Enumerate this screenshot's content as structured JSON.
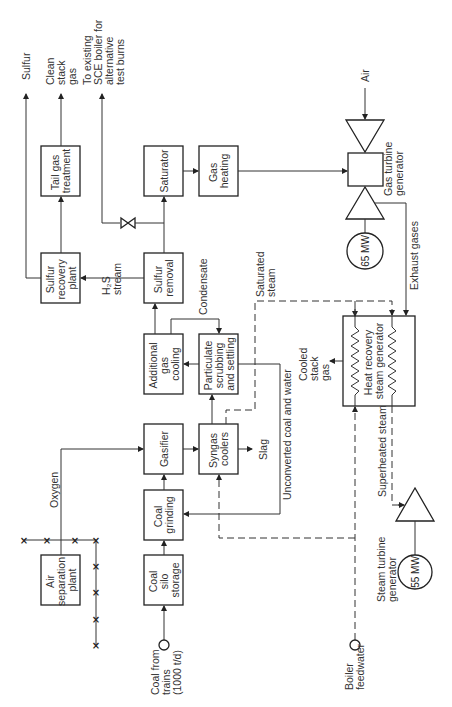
{
  "diagram": {
    "title": "",
    "boxes": {
      "tail_gas": [
        "Tail gas",
        "treatment"
      ],
      "saturator": [
        "Saturator"
      ],
      "gas_heating": [
        "Gas",
        "heating"
      ],
      "sulfur_recovery": [
        "Sulfur",
        "recovery",
        "plant"
      ],
      "sulfur_removal": [
        "Sulfur",
        "removal"
      ],
      "additional_cooling": [
        "Additional",
        "gas",
        "cooling"
      ],
      "particulate": [
        "Particulate",
        "scrubbing",
        "and settling"
      ],
      "gasifier": [
        "Gasifier"
      ],
      "syngas_coolers": [
        "Syngas",
        "coolers"
      ],
      "coal_grinding": [
        "Coal",
        "grinding"
      ],
      "coal_silo": [
        "Coal",
        "silo",
        "storage"
      ],
      "air_separation": [
        "Air",
        "separation",
        "plant"
      ],
      "hrsg": [
        "Heat recovery",
        "steam generator"
      ]
    },
    "labels": {
      "sulfur": [
        "Sulfur"
      ],
      "clean_stack": [
        "Clean",
        "stack",
        "gas"
      ],
      "sce_boiler": [
        "To existing",
        "SCE boiler for",
        "alternative",
        "test burns"
      ],
      "air": [
        "Air"
      ],
      "gas_turbine": [
        "Gas turbine",
        "generator"
      ],
      "h2s": [
        "H₂S",
        "stream"
      ],
      "condensate": [
        "Condensate"
      ],
      "saturated_steam": [
        "Saturated",
        "steam"
      ],
      "exhaust": [
        "Exhaust gases"
      ],
      "cooled_stack": [
        "Cooled",
        "stack",
        "gas"
      ],
      "oxygen": [
        "Oxygen"
      ],
      "slag": [
        "Slag"
      ],
      "unconverted": [
        "Unconverted coal and water"
      ],
      "superheated": [
        "Superheated steam"
      ],
      "steam_turbine": [
        "Steam turbine",
        "generator"
      ],
      "coal_from_trains": [
        "Coal from",
        "trains",
        "(1000 t/d)"
      ],
      "boiler_feedwater": [
        "Boiler",
        "feedwater"
      ]
    },
    "generators": {
      "gas_mw": "65 MW",
      "steam_mw": "55 MW"
    },
    "marks": {
      "x": "×"
    }
  }
}
